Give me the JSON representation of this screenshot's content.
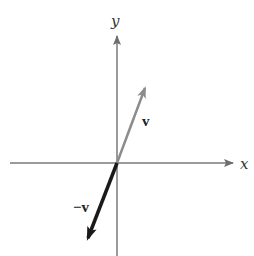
{
  "diagram": {
    "type": "vector-diagram",
    "axes": {
      "x_label": "x",
      "y_label": "y",
      "origin_px": [
        117,
        163
      ],
      "color": "#7a7a7a"
    },
    "vectors": [
      {
        "id": "v",
        "label": "v",
        "from_px": [
          117,
          163
        ],
        "to_px": [
          145,
          88
        ],
        "color": "#8c8c8c",
        "width": 2.5
      },
      {
        "id": "neg-v",
        "label": "−v",
        "from_px": [
          117,
          163
        ],
        "to_px": [
          88,
          238
        ],
        "color": "#1a1a1a",
        "width": 3.5
      }
    ]
  }
}
